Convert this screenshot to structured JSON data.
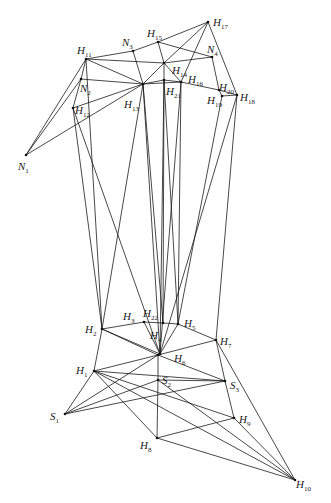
{
  "figure": {
    "caption": "",
    "nodes": [
      {
        "id": "N1",
        "x": 26,
        "y": 155,
        "label": "N",
        "sub": "1",
        "lx": 18,
        "ly": 170
      },
      {
        "id": "N2",
        "x": 81,
        "y": 79,
        "label": "N",
        "sub": "2",
        "lx": 80,
        "ly": 92
      },
      {
        "id": "N3",
        "x": 133,
        "y": 51,
        "label": "N",
        "sub": "3",
        "lx": 122,
        "ly": 46
      },
      {
        "id": "N4",
        "x": 212,
        "y": 57,
        "label": "N",
        "sub": "4",
        "lx": 207,
        "ly": 53
      },
      {
        "id": "H1",
        "x": 94,
        "y": 371,
        "label": "H",
        "sub": "1",
        "lx": 76,
        "ly": 374
      },
      {
        "id": "H2",
        "x": 102,
        "y": 329,
        "label": "H",
        "sub": "2",
        "lx": 85,
        "ly": 333
      },
      {
        "id": "H3",
        "x": 144,
        "y": 322,
        "label": "H",
        "sub": "3",
        "lx": 123,
        "ly": 320
      },
      {
        "id": "H4",
        "x": 160,
        "y": 354,
        "label": "H",
        "sub": "4",
        "lx": 150,
        "ly": 339
      },
      {
        "id": "H5",
        "x": 178,
        "y": 324,
        "label": "H",
        "sub": "5",
        "lx": 184,
        "ly": 327
      },
      {
        "id": "H6",
        "x": 158,
        "y": 355,
        "label": "H",
        "sub": "6",
        "lx": 174,
        "ly": 362
      },
      {
        "id": "H7",
        "x": 216,
        "y": 340,
        "label": "H",
        "sub": "7",
        "lx": 220,
        "ly": 345
      },
      {
        "id": "H8",
        "x": 157,
        "y": 438,
        "label": "H",
        "sub": "8",
        "lx": 140,
        "ly": 449
      },
      {
        "id": "H9",
        "x": 234,
        "y": 418,
        "label": "H",
        "sub": "9",
        "lx": 239,
        "ly": 423
      },
      {
        "id": "H10",
        "x": 295,
        "y": 480,
        "label": "H",
        "sub": "10",
        "lx": 296,
        "ly": 488
      },
      {
        "id": "H11",
        "x": 86,
        "y": 59,
        "label": "H",
        "sub": "11",
        "lx": 77,
        "ly": 54
      },
      {
        "id": "H12",
        "x": 73,
        "y": 108,
        "label": "H",
        "sub": "12",
        "lx": 75,
        "ly": 114
      },
      {
        "id": "H13",
        "x": 143,
        "y": 84,
        "label": "H",
        "sub": "13",
        "lx": 124,
        "ly": 108
      },
      {
        "id": "H14",
        "x": 164,
        "y": 63,
        "label": "H",
        "sub": "14",
        "lx": 172,
        "ly": 74
      },
      {
        "id": "H15",
        "x": 158,
        "y": 42,
        "label": "H",
        "sub": "15",
        "lx": 147,
        "ly": 37
      },
      {
        "id": "H16",
        "x": 181,
        "y": 82,
        "label": "H",
        "sub": "16",
        "lx": 188,
        "ly": 83
      },
      {
        "id": "H17",
        "x": 208,
        "y": 22,
        "label": "H",
        "sub": "17",
        "lx": 213,
        "ly": 26
      },
      {
        "id": "H18",
        "x": 237,
        "y": 95,
        "label": "H",
        "sub": "18",
        "lx": 240,
        "ly": 101
      },
      {
        "id": "H19",
        "x": 222,
        "y": 96,
        "label": "H",
        "sub": "19",
        "lx": 207,
        "ly": 104
      },
      {
        "id": "H20",
        "x": 219,
        "y": 90,
        "label": "H",
        "sub": "20",
        "lx": 219,
        "ly": 91
      },
      {
        "id": "H21",
        "x": 164,
        "y": 80,
        "label": "H",
        "sub": "21",
        "lx": 166,
        "ly": 95
      },
      {
        "id": "H22",
        "x": 163,
        "y": 323,
        "label": "H",
        "sub": "22",
        "lx": 143,
        "ly": 317
      }
    ],
    "edges": [
      [
        "N1",
        "H11"
      ],
      [
        "N1",
        "N2"
      ],
      [
        "N1",
        "H13"
      ],
      [
        "H11",
        "N2"
      ],
      [
        "N2",
        "H12"
      ],
      [
        "H11",
        "H13"
      ],
      [
        "N2",
        "H13"
      ],
      [
        "H12",
        "H13"
      ],
      [
        "H11",
        "N3"
      ],
      [
        "N3",
        "H15"
      ],
      [
        "H15",
        "H17"
      ],
      [
        "N3",
        "H13"
      ],
      [
        "H11",
        "H14"
      ],
      [
        "H13",
        "H14"
      ],
      [
        "H13",
        "H21"
      ],
      [
        "H13",
        "H16"
      ],
      [
        "H15",
        "H14"
      ],
      [
        "H15",
        "N4"
      ],
      [
        "H17",
        "H14"
      ],
      [
        "H17",
        "H16"
      ],
      [
        "H17",
        "H18"
      ],
      [
        "H14",
        "N4"
      ],
      [
        "N4",
        "H20"
      ],
      [
        "H21",
        "H16"
      ],
      [
        "H16",
        "H20"
      ],
      [
        "H20",
        "H18"
      ],
      [
        "H19",
        "H18"
      ],
      [
        "H20",
        "H19"
      ],
      [
        "H14",
        "H16"
      ],
      [
        "H14",
        "H21"
      ],
      [
        "H12",
        "H2"
      ],
      [
        "H12",
        "H4"
      ],
      [
        "H11",
        "H2"
      ],
      [
        "H13",
        "H2"
      ],
      [
        "H13",
        "H22"
      ],
      [
        "H13",
        "H4"
      ],
      [
        "H21",
        "H22"
      ],
      [
        "H21",
        "H4"
      ],
      [
        "H16",
        "H5"
      ],
      [
        "H16",
        "H4"
      ],
      [
        "H18",
        "H4"
      ],
      [
        "H18",
        "H7"
      ],
      [
        "H19",
        "H5"
      ],
      [
        "H21",
        "H5"
      ],
      [
        "H2",
        "H3"
      ],
      [
        "H3",
        "H22"
      ],
      [
        "H22",
        "H5"
      ],
      [
        "H3",
        "H4"
      ],
      [
        "H4",
        "H5"
      ],
      [
        "H2",
        "H6"
      ],
      [
        "H6",
        "H7"
      ],
      [
        "H5",
        "H7"
      ],
      [
        "H2",
        "H1"
      ],
      [
        "H1",
        "H6"
      ],
      [
        "H1",
        "S3"
      ],
      [
        "H1",
        "S1"
      ],
      [
        "H1",
        "H9"
      ],
      [
        "H1",
        "H8"
      ],
      [
        "H1",
        "H10"
      ],
      [
        "H6",
        "S2"
      ],
      [
        "H6",
        "S3"
      ],
      [
        "H6",
        "S1"
      ],
      [
        "S2",
        "S1"
      ],
      [
        "S2",
        "H8"
      ],
      [
        "S3",
        "S1"
      ],
      [
        "S2",
        "S3"
      ],
      [
        "S2",
        "H10"
      ],
      [
        "H7",
        "S3"
      ],
      [
        "S3",
        "H9"
      ],
      [
        "H7",
        "H10"
      ],
      [
        "H9",
        "H10"
      ],
      [
        "H8",
        "H9"
      ],
      [
        "H8",
        "H10"
      ],
      [
        "H2",
        "H4"
      ]
    ],
    "extra_nodes": [
      {
        "id": "S1",
        "x": 65,
        "y": 414,
        "label": "S",
        "sub": "1",
        "lx": 50,
        "ly": 420
      },
      {
        "id": "S2",
        "x": 158,
        "y": 380,
        "label": "S",
        "sub": "2",
        "lx": 162,
        "ly": 384
      },
      {
        "id": "S3",
        "x": 225,
        "y": 381,
        "label": "S",
        "sub": "3",
        "lx": 230,
        "ly": 389
      }
    ]
  }
}
